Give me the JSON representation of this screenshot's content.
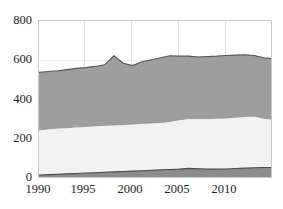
{
  "chart_data": {
    "type": "area",
    "title": "",
    "subtitle": "",
    "xlabel": "",
    "ylabel": "",
    "stacked": true,
    "grid": true,
    "legend": "none",
    "xlim": [
      1990,
      2015
    ],
    "ylim": [
      0,
      800
    ],
    "ytick_labels": [
      "0",
      "200",
      "400",
      "600",
      "800"
    ],
    "ytick_values": [
      0,
      200,
      400,
      600,
      800
    ],
    "xtick_labels": [
      "1990",
      "1995",
      "2000",
      "2005",
      "2010"
    ],
    "xtick_values": [
      1990,
      1995,
      2000,
      2005,
      2010
    ],
    "x": [
      1990,
      1991,
      1992,
      1993,
      1994,
      1995,
      1996,
      1997,
      1998,
      1999,
      2000,
      2001,
      2002,
      2003,
      2004,
      2005,
      2006,
      2007,
      2008,
      2009,
      2010,
      2011,
      2012,
      2013,
      2014,
      2015
    ],
    "series": [
      {
        "name": "series-bottom",
        "color": "#8c8c8c",
        "values": [
          20,
          22,
          24,
          26,
          28,
          30,
          32,
          34,
          36,
          38,
          40,
          42,
          44,
          46,
          48,
          50,
          54,
          52,
          50,
          50,
          51,
          53,
          55,
          57,
          58,
          58
        ]
      },
      {
        "name": "series-middle",
        "color": "#f2f2f2",
        "values": [
          228,
          232,
          234,
          234,
          236,
          236,
          238,
          238,
          238,
          238,
          238,
          240,
          240,
          240,
          244,
          250,
          252,
          254,
          256,
          258,
          258,
          260,
          262,
          262,
          250,
          244
        ]
      },
      {
        "name": "series-top",
        "color": "#9e9e9e",
        "values": [
          292,
          290,
          290,
          294,
          296,
          298,
          300,
          306,
          350,
          310,
          296,
          312,
          320,
          328,
          332,
          322,
          316,
          312,
          314,
          314,
          316,
          314,
          312,
          306,
          306,
          306
        ]
      }
    ],
    "totals": [
      540,
      544,
      548,
      554,
      560,
      564,
      570,
      578,
      624,
      586,
      574,
      594,
      604,
      614,
      624,
      622,
      622,
      618,
      620,
      622,
      625,
      627,
      629,
      625,
      614,
      608
    ]
  },
  "colors": {
    "background": "#ffffff",
    "frame": "#c8c8c8",
    "gridline_vertical": "#e2e2e2",
    "gridline_horizontal": "#ededed",
    "tick_text": "#1c1c1c",
    "band_bottom": "#8c8c8c",
    "band_middle": "#f2f2f2",
    "band_top": "#9e9e9e",
    "band_outline": "#555555"
  }
}
